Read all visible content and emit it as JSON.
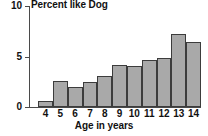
{
  "chart_data": {
    "type": "bar",
    "title": "Percent like Dog",
    "xlabel": "Age in years",
    "ylabel": "",
    "categories": [
      "4",
      "5",
      "6",
      "7",
      "8",
      "9",
      "10",
      "11",
      "12",
      "13",
      "14"
    ],
    "values": [
      0.6,
      2.6,
      2.0,
      2.5,
      3.1,
      4.2,
      4.1,
      4.7,
      4.9,
      7.2,
      6.4
    ],
    "xlim": [
      4,
      15
    ],
    "ylim": [
      0,
      10
    ],
    "ytick_labels": [
      "10",
      "5",
      "0"
    ],
    "ytick_values": [
      10,
      5,
      0
    ],
    "grid": false,
    "legend": false,
    "bar_fill_color": "#a9a9a9",
    "bar_edge_color": "#3c3c3c",
    "axis_color": "#4a4a4a",
    "text_color": "#111111",
    "background_color": "#ffffff"
  }
}
